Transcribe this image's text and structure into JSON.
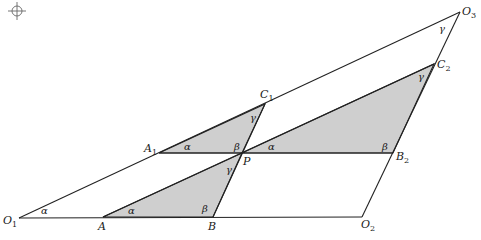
{
  "diagram": {
    "title": "",
    "fill_color": "#cfcfcf",
    "line_color": "#222222",
    "points": {
      "O1": {
        "x": 19,
        "y": 218,
        "label": "O",
        "sub": "1"
      },
      "O2": {
        "x": 362,
        "y": 217,
        "label": "O",
        "sub": "2"
      },
      "O3": {
        "x": 460,
        "y": 12,
        "label": "O",
        "sub": "3"
      },
      "A": {
        "x": 103,
        "y": 217,
        "label": "A",
        "sub": ""
      },
      "B": {
        "x": 213,
        "y": 217,
        "label": "B",
        "sub": ""
      },
      "A1": {
        "x": 159,
        "y": 153,
        "label": "A",
        "sub": "1"
      },
      "P": {
        "x": 242,
        "y": 153,
        "label": "P",
        "sub": ""
      },
      "B2": {
        "x": 393,
        "y": 153,
        "label": "B",
        "sub": "2"
      },
      "C1": {
        "x": 265,
        "y": 104,
        "label": "C",
        "sub": "1"
      },
      "C2": {
        "x": 434,
        "y": 64,
        "label": "C",
        "sub": "2"
      }
    },
    "shaded_triangles": [
      {
        "name": "triangle-A1-P-C1",
        "vertices": [
          "A1",
          "P",
          "C1"
        ]
      },
      {
        "name": "triangle-P-B2-C2",
        "vertices": [
          "P",
          "B2",
          "C2"
        ]
      },
      {
        "name": "triangle-A-B-P",
        "vertices": [
          "A",
          "B",
          "P"
        ]
      }
    ],
    "angle_labels": [
      {
        "text": "α",
        "x": 41,
        "y": 214
      },
      {
        "text": "α",
        "x": 128,
        "y": 214
      },
      {
        "text": "β",
        "x": 202,
        "y": 212
      },
      {
        "text": "γ",
        "x": 226,
        "y": 173
      },
      {
        "text": "α",
        "x": 184,
        "y": 150
      },
      {
        "text": "β",
        "x": 234,
        "y": 150
      },
      {
        "text": "γ",
        "x": 250,
        "y": 121
      },
      {
        "text": "α",
        "x": 268,
        "y": 150
      },
      {
        "text": "β",
        "x": 382,
        "y": 150
      },
      {
        "text": "γ",
        "x": 418,
        "y": 80
      },
      {
        "text": "γ",
        "x": 439,
        "y": 32
      }
    ],
    "registration_mark": "crosshair-circle"
  }
}
